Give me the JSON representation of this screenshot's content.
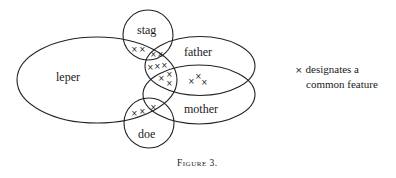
{
  "figure": {
    "caption": "Figure 3.",
    "sets": [
      {
        "id": "leper",
        "label": "leper"
      },
      {
        "id": "stag",
        "label": "stag"
      },
      {
        "id": "father",
        "label": "father"
      },
      {
        "id": "mother",
        "label": "mother"
      },
      {
        "id": "doe",
        "label": "doe"
      }
    ],
    "marker": "×",
    "legend": {
      "marker": "×",
      "line1": "designates a",
      "line2": "common feature"
    },
    "intersections": [
      {
        "between": [
          "leper",
          "stag"
        ],
        "count": 2
      },
      {
        "between": [
          "leper",
          "stag",
          "father"
        ],
        "count": 2
      },
      {
        "between": [
          "leper",
          "father"
        ],
        "count": 3
      },
      {
        "between": [
          "leper",
          "father",
          "mother"
        ],
        "count": 3
      },
      {
        "between": [
          "father",
          "mother"
        ],
        "count": 3
      },
      {
        "between": [
          "leper",
          "doe"
        ],
        "count": 2
      },
      {
        "between": [
          "leper",
          "doe",
          "mother"
        ],
        "count": 1
      }
    ]
  }
}
